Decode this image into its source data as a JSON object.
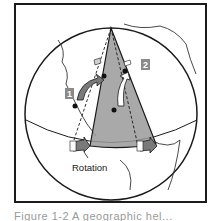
{
  "figure": {
    "labels": {
      "marker_1": "1",
      "marker_2": "2",
      "rotation": "Rotation"
    },
    "caption": "Figure 1-2  A geographic hel...",
    "colors": {
      "wedge_fill": "#9a9a9a",
      "label_box": "#8a8a8a",
      "arrow_fill": "#7a7a7a",
      "outline": "#1a1a1a"
    }
  }
}
